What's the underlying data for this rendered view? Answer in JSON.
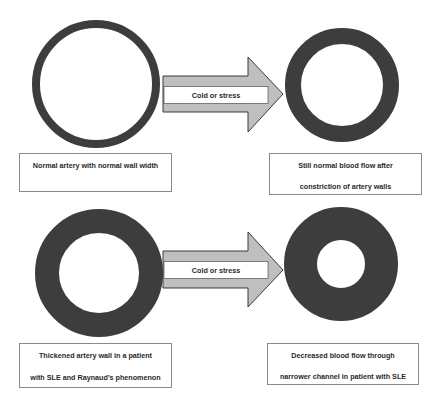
{
  "colors": {
    "vessel_wall": "#3d3d3d",
    "vessel_lumen": "#ffffff",
    "arrow_fill": "#bfbfbf",
    "arrow_stroke": "#3a3a3a",
    "label_border": "#8a8a8a",
    "text": "#2a2a2a"
  },
  "rows": [
    {
      "name": "normal",
      "before": {
        "vessel": "normal-artery",
        "wall": "thin",
        "label_lines": [
          "Normal artery with normal wall width"
        ]
      },
      "arrow": {
        "label": "Cold or stress"
      },
      "after": {
        "vessel": "constricted-normal-artery",
        "wall": "moderate",
        "label_lines": [
          "Still normal blood flow after",
          "constriction of artery walls"
        ]
      }
    },
    {
      "name": "sle",
      "before": {
        "vessel": "thickened-artery",
        "wall": "thick",
        "label_lines": [
          "Thickened artery wall in a patient",
          "with SLE and Raynaud’s phenomenon"
        ]
      },
      "arrow": {
        "label": "Cold or stress"
      },
      "after": {
        "vessel": "narrowed-artery",
        "wall": "very-thick",
        "label_lines": [
          "Decreased blood flow through",
          "narrower channel in patient with SLE"
        ]
      }
    }
  ]
}
